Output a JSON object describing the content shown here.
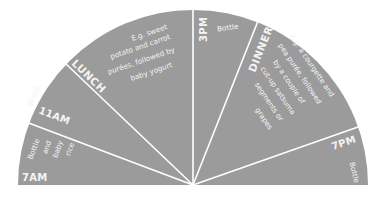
{
  "colors": {
    "fill": "#9b9b9b",
    "divider": "#ffffff",
    "text": "#f4f4f4",
    "background": "#ffffff"
  },
  "segments": [
    {
      "id": "7am",
      "time_label": "7AM",
      "note_lines": [
        "Bottle",
        "and",
        "baby",
        "rice"
      ]
    },
    {
      "id": "11am",
      "time_label": "11AM",
      "note_lines": [
        "Bottle"
      ]
    },
    {
      "id": "lunch",
      "time_label": "LUNCH",
      "note_lines": [
        "E.g. sweet",
        "potato and carrot",
        "purées, followed by",
        "baby yogurt"
      ]
    },
    {
      "id": "3pm",
      "time_label": "3PM",
      "note_lines": [
        "Bottle"
      ]
    },
    {
      "id": "dinner",
      "time_label": "DINNER",
      "note_lines": [
        "E.g. a courgette and",
        "pea purée, followed",
        "by a couple of",
        "cut-up satsuma",
        "segments or",
        "grapes"
      ]
    },
    {
      "id": "7pm",
      "time_label": "7PM",
      "note_lines": [
        "Bottle"
      ]
    }
  ]
}
